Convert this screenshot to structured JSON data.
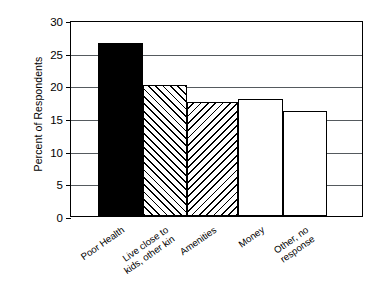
{
  "chart_data": {
    "type": "bar",
    "title": "",
    "subtitle": "",
    "xlabel": "",
    "ylabel": "Percent of Respondents",
    "ylim": [
      0,
      30
    ],
    "ytick_labels": [
      "0",
      "5",
      "10",
      "15",
      "20",
      "25",
      "30"
    ],
    "ytick_values": [
      0,
      5,
      10,
      15,
      20,
      25,
      30
    ],
    "grid": "horizontal",
    "legend": "none",
    "categories": [
      "Poor Health",
      "Live close to\nkids, other kin",
      "Amenities",
      "Money",
      "Other, no\nresponse"
    ],
    "values": [
      26.5,
      20.0,
      17.5,
      17.9,
      16.1
    ],
    "bar_fills": [
      "solid-black",
      "hatch-left",
      "hatch-right",
      "white",
      "white"
    ],
    "annotations": []
  },
  "axes": {
    "y_title": "Percent of Respondents"
  },
  "colors": {
    "axis": "#000000",
    "grid": "#555a5e",
    "bar_solid": "#000000",
    "bar_outline": "#000000",
    "background": "#ffffff"
  }
}
